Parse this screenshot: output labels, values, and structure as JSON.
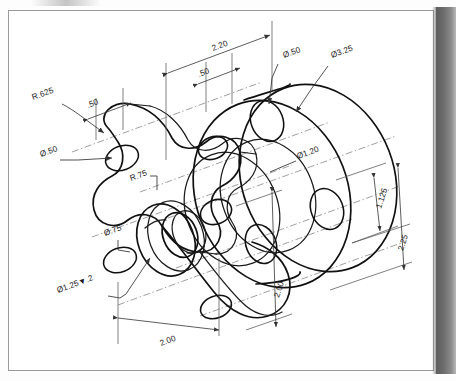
{
  "drawing": {
    "title": "Isometric mechanical part drawing",
    "type": "isometric-technical-drawing",
    "sheet": {
      "border": true,
      "background_color": "#ffffff",
      "line_color": "#111111"
    },
    "scan_artifact": {
      "right_gutter_color": "#6b6b6b",
      "present": true
    },
    "dimensions": [
      {
        "id": "d-220",
        "label": "2.20",
        "kind": "linear",
        "x": 213,
        "y": 51,
        "rotate": -20
      },
      {
        "id": "d-50-top",
        "label": ".50",
        "kind": "linear",
        "x": 199,
        "y": 77,
        "rotate": -20
      },
      {
        "id": "d-50-left",
        "label": ".50",
        "kind": "linear",
        "x": 88,
        "y": 108,
        "rotate": -20
      },
      {
        "id": "d-r625",
        "label": "R.625",
        "kind": "radius",
        "x": 35,
        "y": 99,
        "rotate": -20
      },
      {
        "id": "d-dia50-l",
        "label": "Ø.50",
        "kind": "diameter",
        "x": 43,
        "y": 155,
        "rotate": -20
      },
      {
        "id": "d-r75",
        "label": "R.75",
        "kind": "radius",
        "x": 132,
        "y": 180,
        "rotate": -20
      },
      {
        "id": "d-dia50-t",
        "label": "Ø.50",
        "kind": "diameter",
        "x": 286,
        "y": 57,
        "rotate": -20
      },
      {
        "id": "d-dia325",
        "label": "Ø3.25",
        "kind": "diameter",
        "x": 334,
        "y": 57,
        "rotate": -20
      },
      {
        "id": "d-dia120",
        "label": "Ø1.20",
        "kind": "diameter",
        "x": 300,
        "y": 158,
        "rotate": -20
      },
      {
        "id": "d-dia75",
        "label": "Ø.75",
        "kind": "diameter",
        "x": 107,
        "y": 235,
        "rotate": -20
      },
      {
        "id": "d-dia125",
        "label": "Ø1.25▼.2",
        "kind": "counterbore",
        "x": 60,
        "y": 292,
        "rotate": -20
      },
      {
        "id": "d-1125",
        "label": "1.125",
        "kind": "linear",
        "x": 382,
        "y": 208,
        "rotate": -72
      },
      {
        "id": "d-225",
        "label": "2.25",
        "kind": "linear",
        "x": 404,
        "y": 250,
        "rotate": -72
      },
      {
        "id": "d-200-mid",
        "label": "2.00",
        "kind": "linear",
        "x": 280,
        "y": 297,
        "rotate": -72
      },
      {
        "id": "d-200-bot",
        "label": "2.00",
        "kind": "linear",
        "x": 163,
        "y": 345,
        "rotate": -20
      }
    ]
  }
}
